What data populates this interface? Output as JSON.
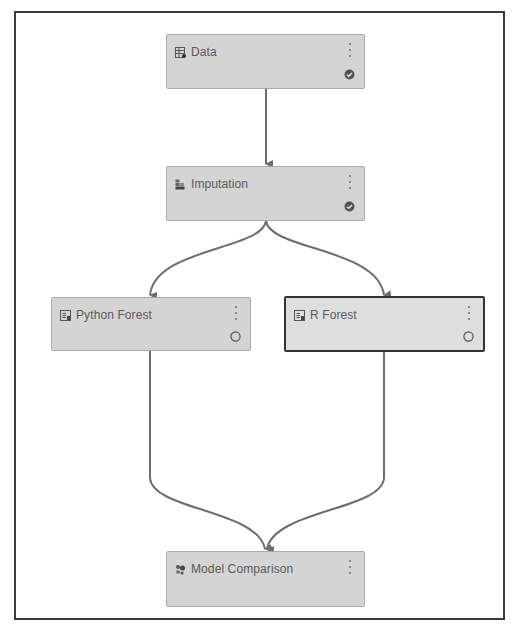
{
  "canvas": {
    "border_color": "#3a3a3a",
    "node_fill": "#d4d4d4",
    "connector_color": "#6e6e6e"
  },
  "nodes": [
    {
      "id": "data",
      "label": "Data",
      "icon": "data-table-icon",
      "status": "completed",
      "status_icon": "check-circle-icon",
      "selected": false
    },
    {
      "id": "imputation",
      "label": "Imputation",
      "icon": "imputation-icon",
      "status": "completed",
      "status_icon": "check-circle-icon",
      "selected": false
    },
    {
      "id": "python_forest",
      "label": "Python Forest",
      "icon": "code-node-icon",
      "status": "pending",
      "status_icon": "empty-circle-icon",
      "selected": false
    },
    {
      "id": "r_forest",
      "label": "R Forest",
      "icon": "code-node-icon",
      "status": "pending",
      "status_icon": "empty-circle-icon",
      "selected": true
    },
    {
      "id": "model_comparison",
      "label": "Model Comparison",
      "icon": "model-comparison-icon",
      "status": "none",
      "selected": false
    }
  ],
  "edges": [
    {
      "from": "data",
      "to": "imputation"
    },
    {
      "from": "imputation",
      "to": "python_forest"
    },
    {
      "from": "imputation",
      "to": "r_forest"
    },
    {
      "from": "python_forest",
      "to": "model_comparison"
    },
    {
      "from": "r_forest",
      "to": "model_comparison"
    }
  ]
}
